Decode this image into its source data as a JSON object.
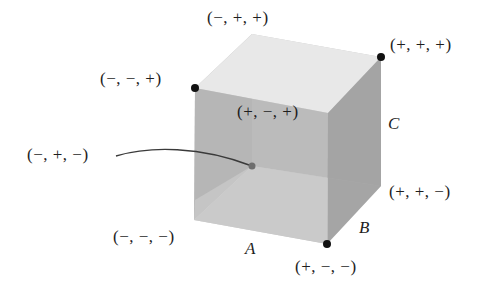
{
  "diagram": {
    "type": "cube-vertex-sign-diagram",
    "vertices": [
      {
        "id": "mmp",
        "label": "(−, −, +)",
        "marker": "black-dot"
      },
      {
        "id": "mpp",
        "label": "(−, +, +)",
        "marker": "none"
      },
      {
        "id": "ppp",
        "label": "(+, +, +)",
        "marker": "black-dot"
      },
      {
        "id": "pmp",
        "label": "(+, −, +)",
        "marker": "none"
      },
      {
        "id": "mpm",
        "label": "(−, +, −)",
        "marker": "gray-dot-hidden"
      },
      {
        "id": "mmm",
        "label": "(−, −, −)",
        "marker": "none"
      },
      {
        "id": "ppm",
        "label": "(+, +, −)",
        "marker": "none"
      },
      {
        "id": "pmm",
        "label": "(+, −, −)",
        "marker": "black-dot"
      }
    ],
    "axes": [
      {
        "id": "A",
        "label": "A"
      },
      {
        "id": "B",
        "label": "B"
      },
      {
        "id": "C",
        "label": "C"
      }
    ],
    "colors": {
      "top_face": "#e6e6e6",
      "front_face": "#b4b4b4",
      "right_face": "#a3a3a3",
      "bottom_face": "#d0d0d0",
      "back_face": "#c4c4c4",
      "vertex_dot": "#111111",
      "hidden_dot": "#6e6e6e",
      "leader_line": "#3a3a3a"
    }
  }
}
